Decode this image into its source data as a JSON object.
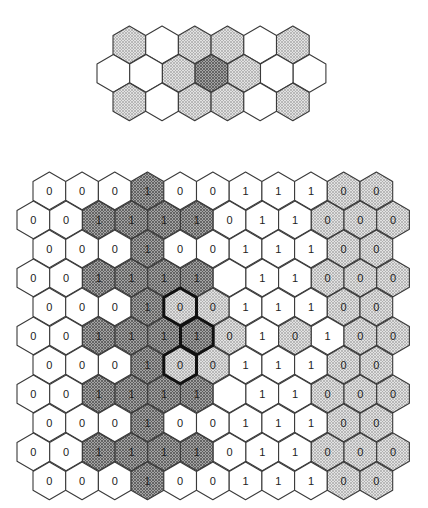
{
  "colors": {
    "white": "#ffffff",
    "light": "#d4d4d4",
    "dark": "#8c8c8c",
    "stroke": "#3a3a3a",
    "bold_stroke": "#111111"
  },
  "legend_key": {
    "W": "unshaded cell",
    "L": "light crosshatched cell",
    "D": "dark crosshatched cell"
  },
  "top_strip": {
    "hex_width": 32.7,
    "row_step": 28.5,
    "top": 26,
    "rows": [
      {
        "left": 113,
        "cells": [
          "L",
          "W",
          "L",
          "L",
          "W",
          "L"
        ]
      },
      {
        "left": 97,
        "cells": [
          "W",
          "W",
          "L",
          "D",
          "L",
          "W",
          "W"
        ]
      },
      {
        "left": 113,
        "cells": [
          "L",
          "W",
          "L",
          "L",
          "W",
          "L"
        ]
      }
    ]
  },
  "bottom_grid": {
    "hex_width": 32.7,
    "row_step": 29,
    "top": 172,
    "rows": [
      {
        "left": 33,
        "cells": [
          [
            "W",
            "0"
          ],
          [
            "W",
            "0"
          ],
          [
            "W",
            "0"
          ],
          [
            "D",
            "1"
          ],
          [
            "W",
            "0"
          ],
          [
            "W",
            "0"
          ],
          [
            "W",
            "1"
          ],
          [
            "W",
            "1"
          ],
          [
            "W",
            "1"
          ],
          [
            "L",
            "0"
          ],
          [
            "L",
            "0"
          ]
        ]
      },
      {
        "left": 17,
        "cells": [
          [
            "W",
            "0"
          ],
          [
            "W",
            "0"
          ],
          [
            "D",
            "1"
          ],
          [
            "D",
            "1"
          ],
          [
            "D",
            "1"
          ],
          [
            "D",
            "1"
          ],
          [
            "W",
            "0"
          ],
          [
            "W",
            "1"
          ],
          [
            "W",
            "1"
          ],
          [
            "L",
            "0"
          ],
          [
            "L",
            "0"
          ],
          [
            "L",
            "0"
          ]
        ]
      },
      {
        "left": 33,
        "cells": [
          [
            "W",
            "0"
          ],
          [
            "W",
            "0"
          ],
          [
            "W",
            "0"
          ],
          [
            "D",
            "1"
          ],
          [
            "W",
            "0"
          ],
          [
            "W",
            "0"
          ],
          [
            "W",
            "1"
          ],
          [
            "W",
            "1"
          ],
          [
            "W",
            "1"
          ],
          [
            "L",
            "0"
          ],
          [
            "L",
            "0"
          ]
        ]
      },
      {
        "left": 17,
        "cells": [
          [
            "W",
            "0"
          ],
          [
            "W",
            "0"
          ],
          [
            "D",
            "1"
          ],
          [
            "D",
            "1"
          ],
          [
            "D",
            "1"
          ],
          [
            "D",
            "1"
          ],
          [
            "W",
            ""
          ],
          [
            "W",
            "1"
          ],
          [
            "W",
            "1"
          ],
          [
            "L",
            "0"
          ],
          [
            "L",
            "0"
          ],
          [
            "L",
            "0"
          ]
        ]
      },
      {
        "left": 33,
        "cells": [
          [
            "W",
            "0"
          ],
          [
            "W",
            "0"
          ],
          [
            "W",
            "0"
          ],
          [
            "D",
            "1"
          ],
          [
            "L",
            "0",
            "bold"
          ],
          [
            "L",
            "0"
          ],
          [
            "W",
            "1"
          ],
          [
            "W",
            "1"
          ],
          [
            "W",
            "1"
          ],
          [
            "L",
            "0"
          ],
          [
            "L",
            "0"
          ]
        ]
      },
      {
        "left": 17,
        "cells": [
          [
            "W",
            "0"
          ],
          [
            "W",
            "0"
          ],
          [
            "D",
            "1"
          ],
          [
            "D",
            "1"
          ],
          [
            "D",
            "1"
          ],
          [
            "D",
            "1",
            "bold"
          ],
          [
            "L",
            "0"
          ],
          [
            "W",
            "1"
          ],
          [
            "L",
            "0"
          ],
          [
            "W",
            "1"
          ],
          [
            "L",
            "0"
          ],
          [
            "L",
            "0"
          ]
        ]
      },
      {
        "left": 33,
        "cells": [
          [
            "W",
            "0"
          ],
          [
            "W",
            "0"
          ],
          [
            "W",
            "0"
          ],
          [
            "D",
            "1"
          ],
          [
            "L",
            "0",
            "bold"
          ],
          [
            "L",
            "0"
          ],
          [
            "W",
            "1"
          ],
          [
            "W",
            "1"
          ],
          [
            "W",
            "1"
          ],
          [
            "L",
            "0"
          ],
          [
            "L",
            "0"
          ]
        ]
      },
      {
        "left": 17,
        "cells": [
          [
            "W",
            "0"
          ],
          [
            "W",
            "0"
          ],
          [
            "D",
            "1"
          ],
          [
            "D",
            "1"
          ],
          [
            "D",
            "1"
          ],
          [
            "D",
            "1"
          ],
          [
            "W",
            ""
          ],
          [
            "W",
            "1"
          ],
          [
            "W",
            "1"
          ],
          [
            "L",
            "0"
          ],
          [
            "L",
            "0"
          ],
          [
            "L",
            "0"
          ]
        ]
      },
      {
        "left": 33,
        "cells": [
          [
            "W",
            "0"
          ],
          [
            "W",
            "0"
          ],
          [
            "W",
            "0"
          ],
          [
            "D",
            "1"
          ],
          [
            "W",
            "0"
          ],
          [
            "W",
            "0"
          ],
          [
            "W",
            "1"
          ],
          [
            "W",
            "1"
          ],
          [
            "W",
            "1"
          ],
          [
            "L",
            "0"
          ],
          [
            "L",
            "0"
          ]
        ]
      },
      {
        "left": 17,
        "cells": [
          [
            "W",
            "0"
          ],
          [
            "W",
            "0"
          ],
          [
            "D",
            "1"
          ],
          [
            "D",
            "1"
          ],
          [
            "D",
            "1"
          ],
          [
            "D",
            "1"
          ],
          [
            "W",
            "0"
          ],
          [
            "W",
            "1"
          ],
          [
            "W",
            "1"
          ],
          [
            "L",
            "0"
          ],
          [
            "L",
            "0"
          ],
          [
            "L",
            "0"
          ]
        ]
      },
      {
        "left": 33,
        "cells": [
          [
            "W",
            "0"
          ],
          [
            "W",
            "0"
          ],
          [
            "W",
            "0"
          ],
          [
            "D",
            "1"
          ],
          [
            "W",
            "0"
          ],
          [
            "W",
            "0"
          ],
          [
            "W",
            "1"
          ],
          [
            "W",
            "1"
          ],
          [
            "W",
            "1"
          ],
          [
            "L",
            "0"
          ],
          [
            "L",
            "0"
          ]
        ]
      }
    ]
  }
}
